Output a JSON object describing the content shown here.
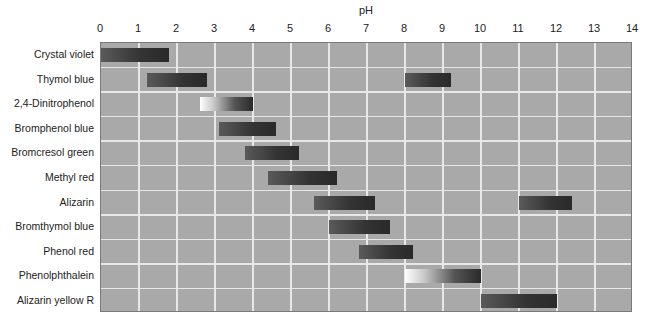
{
  "chart_data": {
    "type": "bar",
    "subtype": "range-bar",
    "title": "",
    "xlabel": "pH",
    "ylabel": "",
    "xlim": [
      0,
      14
    ],
    "x_ticks": [
      "0",
      "1",
      "2",
      "3",
      "4",
      "5",
      "6",
      "7",
      "8",
      "9",
      "10",
      "11",
      "12",
      "13",
      "14"
    ],
    "grid": true,
    "legend": null,
    "categories": [
      "Crystal violet",
      "Thymol blue",
      "2,4-Dinitrophenol",
      "Bromphenol blue",
      "Bromcresol green",
      "Methyl red",
      "Alizarin",
      "Bromthymol blue",
      "Phenol red",
      "Phenolphthalein",
      "Alizarin yellow R"
    ],
    "ranges": [
      [
        [
          0.0,
          1.8
        ]
      ],
      [
        [
          1.2,
          2.8
        ],
        [
          8.0,
          9.2
        ]
      ],
      [
        [
          2.6,
          4.0
        ]
      ],
      [
        [
          3.1,
          4.6
        ]
      ],
      [
        [
          3.8,
          5.2
        ]
      ],
      [
        [
          4.4,
          6.2
        ]
      ],
      [
        [
          5.6,
          7.2
        ],
        [
          11.0,
          12.4
        ]
      ],
      [
        [
          6.0,
          7.6
        ]
      ],
      [
        [
          6.8,
          8.2
        ]
      ],
      [
        [
          8.0,
          10.0
        ]
      ],
      [
        [
          10.0,
          12.0
        ]
      ]
    ],
    "light_start_bars": [
      "2,4-Dinitrophenol",
      "Phenolphthalein"
    ],
    "colors": {
      "plot_bg": "#a9a9a9",
      "grid": "#e8e8e8",
      "bar": "#333333"
    }
  }
}
